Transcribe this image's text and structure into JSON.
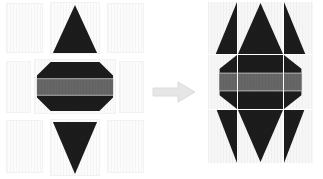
{
  "diagram": {
    "background_color": "#ffffff",
    "arrow": {
      "name": "right-arrow",
      "label": "becomes",
      "color": "#e3e3e3",
      "stroke": "#d2d2d2",
      "direction": "right"
    },
    "palette": {
      "ink_dark": "#1c1c1c",
      "band_gray": "#666666",
      "tile_fill": "#fbfbfb",
      "tile_border": "#f0f0f0",
      "grid_line": "#ffffff"
    },
    "left_figure": {
      "name": "exploded-grid",
      "caption": "",
      "columns": 3,
      "rows": 3,
      "spacing": "gapped",
      "tiles": [
        {
          "id": "r0c0",
          "content": "blank",
          "row": 0,
          "col": 0
        },
        {
          "id": "r0c1",
          "content": "triangle-up",
          "row": 0,
          "col": 1
        },
        {
          "id": "r0c2",
          "content": "blank",
          "row": 0,
          "col": 2
        },
        {
          "id": "r1c0",
          "content": "blank",
          "row": 1,
          "col": 0
        },
        {
          "id": "r1c1",
          "content": "octagon-banded",
          "row": 1,
          "col": 1
        },
        {
          "id": "r1c2",
          "content": "blank",
          "row": 1,
          "col": 2
        },
        {
          "id": "r2c0",
          "content": "blank",
          "row": 2,
          "col": 0
        },
        {
          "id": "r2c1",
          "content": "triangle-down",
          "row": 2,
          "col": 1
        },
        {
          "id": "r2c2",
          "content": "blank",
          "row": 2,
          "col": 2
        }
      ]
    },
    "right_figure": {
      "name": "assembled-grid",
      "caption": "",
      "columns": 3,
      "rows": 3,
      "spacing": "contiguous",
      "tiles": [
        {
          "id": "r0c0",
          "content": "triangle-up-left-half",
          "row": 0,
          "col": 0
        },
        {
          "id": "r0c1",
          "content": "triangle-up-tip",
          "row": 0,
          "col": 1
        },
        {
          "id": "r0c2",
          "content": "triangle-up-right-half",
          "row": 0,
          "col": 2
        },
        {
          "id": "r1c0",
          "content": "band-left",
          "row": 1,
          "col": 0
        },
        {
          "id": "r1c1",
          "content": "octagon-banded",
          "row": 1,
          "col": 1
        },
        {
          "id": "r1c2",
          "content": "band-right",
          "row": 1,
          "col": 2
        },
        {
          "id": "r2c0",
          "content": "triangle-down-left",
          "row": 2,
          "col": 0
        },
        {
          "id": "r2c1",
          "content": "triangle-down-tip",
          "row": 2,
          "col": 1
        },
        {
          "id": "r2c2",
          "content": "triangle-down-right",
          "row": 2,
          "col": 2
        }
      ]
    }
  }
}
